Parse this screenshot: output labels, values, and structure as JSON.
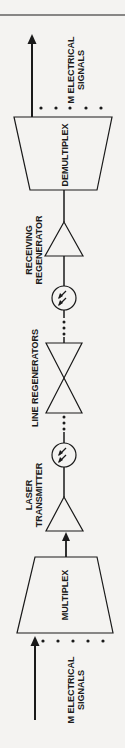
{
  "diagram": {
    "output_signals_label": [
      "M ELECTRICAL",
      "SIGNALS"
    ],
    "demultiplex_label": "DEMULTIPLEX",
    "receiving_regenerator_label": [
      "RECEIVING",
      "REGENERATOR"
    ],
    "line_regenerators_label": "LINE REGENERATORS",
    "laser_transmitter_label": [
      "LASER",
      "TRANSMITTER"
    ],
    "multiplex_label": "MULTIPLEX",
    "input_signals_label": [
      "M ELECTRICAL",
      "SIGNALS"
    ],
    "photodiode_icon": "photodetector-circle-with-arrows",
    "colors": {
      "line": "#1a1a1a",
      "background": "#f4f3f1"
    }
  }
}
